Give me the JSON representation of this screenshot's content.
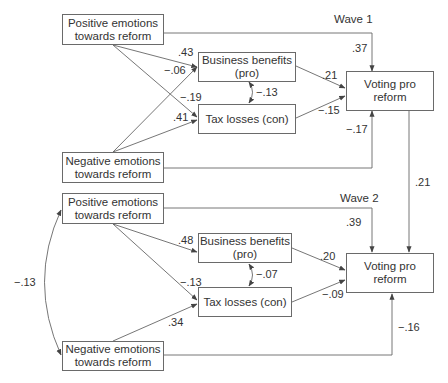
{
  "diagram": {
    "type": "path-model",
    "waves": [
      {
        "label": "Wave 1",
        "nodes": {
          "positive": {
            "line1": "Positive emotions",
            "line2": "towards reform"
          },
          "negative": {
            "line1": "Negative emotions",
            "line2": "towards reform"
          },
          "business": {
            "line1": "Business benefits",
            "line2": "(pro)"
          },
          "tax": {
            "line1": "Tax losses (con)"
          },
          "voting": {
            "line1": "Voting pro",
            "line2": "reform"
          }
        },
        "paths": {
          "pos_to_business": ".43",
          "neg_to_business": "−.06",
          "pos_to_tax": "−.19",
          "neg_to_tax": ".41",
          "business_tax_corr": "−.13",
          "business_to_voting": ".21",
          "tax_to_voting": "−.15",
          "pos_to_voting": ".37",
          "neg_to_voting": "−.17"
        }
      },
      {
        "label": "Wave 2",
        "nodes": {
          "positive": {
            "line1": "Positive emotions",
            "line2": "towards reform"
          },
          "negative": {
            "line1": "Negative emotions",
            "line2": "towards reform"
          },
          "business": {
            "line1": "Business benefits",
            "line2": "(pro)"
          },
          "tax": {
            "line1": "Tax losses (con)"
          },
          "voting": {
            "line1": "Voting pro",
            "line2": "reform"
          }
        },
        "paths": {
          "pos_to_business": ".48",
          "pos_to_tax": "−.13",
          "neg_to_tax": ".34",
          "business_tax_corr": "−.07",
          "business_to_voting": ".20",
          "tax_to_voting": "−.09",
          "pos_to_voting": ".39",
          "neg_to_voting": "−.16",
          "pos_neg_corr": "−.13"
        }
      }
    ],
    "cross_wave": {
      "voting1_to_voting2": ".21"
    },
    "colors": {
      "line": "#555555",
      "text": "#333333",
      "background": "#ffffff"
    }
  }
}
